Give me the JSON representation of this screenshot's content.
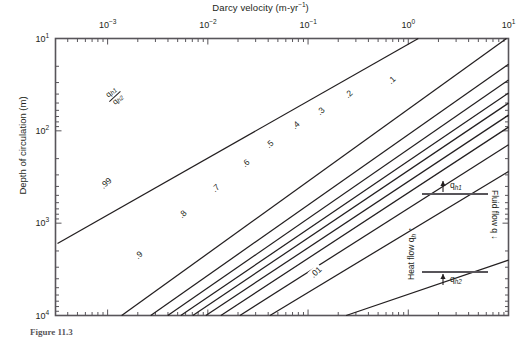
{
  "figure": {
    "caption_prefix": "Figure 11.3",
    "caption_rest": ""
  },
  "axes": {
    "x_title": "Darcy velocity (m·yr⁻¹)",
    "x_title_base": "Darcy velocity (m-yr",
    "x_title_exp": "−1",
    "x_title_tail": ")",
    "y_title": "Depth of circulation (m)",
    "x_ticks": [
      {
        "label_base": "10",
        "label_exp": "−3",
        "value": -3
      },
      {
        "label_base": "10",
        "label_exp": "−2",
        "value": -2
      },
      {
        "label_base": "10",
        "label_exp": "−1",
        "value": -1
      },
      {
        "label_base": "10",
        "label_exp": "0",
        "value": 0
      },
      {
        "label_base": "10",
        "label_exp": "1",
        "value": 1
      }
    ],
    "y_ticks": [
      {
        "label_base": "10",
        "label_exp": "1",
        "value": 1
      },
      {
        "label_base": "10",
        "label_exp": "2",
        "value": 2
      },
      {
        "label_base": "10",
        "label_exp": "3",
        "value": 3
      },
      {
        "label_base": "10",
        "label_exp": "4",
        "value": 4
      }
    ]
  },
  "ratio_annotation": {
    "numerator_base": "q",
    "numerator_sub": "h1",
    "denominator_base": "q",
    "denominator_sub": "h2"
  },
  "inset": {
    "top_arrow_label_base": "q",
    "top_arrow_label_sub": "h1",
    "bottom_arrow_label_base": "q",
    "bottom_arrow_label_sub": "h2",
    "left_label_base": "Heat flow q",
    "left_label_sub": "h",
    "right_label": "Fluid flow q"
  },
  "colors": {
    "line": "#231f20",
    "frame": "#58555a",
    "text": "#231f20",
    "background": "#ffffff"
  },
  "chart_data": {
    "type": "line",
    "xlabel": "Darcy velocity (m-yr^-1)",
    "ylabel": "Depth of circulation (m)",
    "x_scale": "log",
    "y_scale": "log",
    "y_inverted": true,
    "xlim": [
      -3.52,
      1.0
    ],
    "ylim": [
      1.0,
      4.0
    ],
    "grid": false,
    "legend": "none",
    "axis_position": {
      "x": "top",
      "y": "left"
    },
    "series_description": "Contours of the heat-flow ratio q_h1/q_h2 as a function of Darcy velocity and depth of circulation. Each contour is a straight line of slope 1 in log-log space (constant Peclet number).",
    "series": [
      {
        "name": ".99",
        "label": ".99",
        "label_x_log": -3.02,
        "label_y_log": 2.56,
        "x_log": [
          -3.5,
          0.1
        ],
        "y_log": [
          3.22,
          1.0
        ]
      },
      {
        "name": ".9",
        "label": ".9",
        "label_x_log": -2.69,
        "label_y_log": 3.35,
        "x_log": [
          -2.86,
          0.98
        ],
        "y_log": [
          4.0,
          1.0
        ]
      },
      {
        "name": ".8",
        "label": ".8",
        "label_x_log": -2.25,
        "label_y_log": 2.9,
        "x_log": [
          -2.57,
          1.0
        ],
        "y_log": [
          4.0,
          1.28
        ]
      },
      {
        "name": ".7",
        "label": ".7",
        "label_x_log": -1.92,
        "label_y_log": 2.62,
        "x_log": [
          -2.4,
          1.0
        ],
        "y_log": [
          4.0,
          1.45
        ]
      },
      {
        "name": ".6",
        "label": ".6",
        "label_x_log": -1.62,
        "label_y_log": 2.35,
        "x_log": [
          -2.27,
          1.0
        ],
        "y_log": [
          4.0,
          1.59
        ]
      },
      {
        "name": ".5",
        "label": ".5",
        "label_x_log": -1.38,
        "label_y_log": 2.14,
        "x_log": [
          -2.15,
          1.0
        ],
        "y_log": [
          4.0,
          1.7
        ]
      },
      {
        "name": ".4",
        "label": ".4",
        "label_x_log": -1.13,
        "label_y_log": 1.94,
        "x_log": [
          -2.02,
          1.0
        ],
        "y_log": [
          4.0,
          1.83
        ]
      },
      {
        "name": ".3",
        "label": ".3",
        "label_x_log": -0.88,
        "label_y_log": 1.78,
        "x_log": [
          -1.87,
          1.0
        ],
        "y_log": [
          4.0,
          1.96
        ]
      },
      {
        "name": ".2",
        "label": ".2",
        "label_x_log": -0.6,
        "label_y_log": 1.6,
        "x_log": [
          -1.68,
          1.0
        ],
        "y_log": [
          4.0,
          2.15
        ]
      },
      {
        "name": ".1",
        "label": ".1",
        "label_x_log": -0.17,
        "label_y_log": 1.45,
        "x_log": [
          -1.38,
          1.0
        ],
        "y_log": [
          4.0,
          2.44
        ]
      },
      {
        "name": ".01",
        "label": ".01",
        "label_x_log": -0.92,
        "label_y_log": 3.53,
        "x_log": [
          -0.62,
          1.0
        ],
        "y_log": [
          4.0,
          3.4
        ]
      }
    ]
  }
}
